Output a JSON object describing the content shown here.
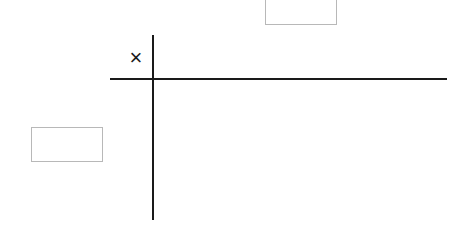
{
  "diagram": {
    "type": "multiplication-grid",
    "operator_symbol": "×",
    "column_header_box": {
      "value": "",
      "role": "top-factor-answer-box"
    },
    "row_header_box": {
      "value": "",
      "role": "left-factor-answer-box"
    },
    "grid_lines": {
      "vertical": {
        "color": "#1a1a1a"
      },
      "horizontal": {
        "color": "#1a1a1a"
      }
    },
    "box_border_color": "#b8b8b8"
  }
}
